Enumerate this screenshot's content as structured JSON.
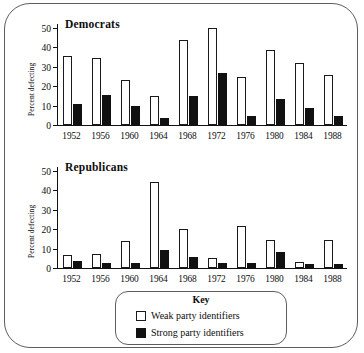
{
  "chart_data": [
    {
      "type": "bar",
      "title": "Democrats",
      "xlabel": "",
      "ylabel": "Percent defecting",
      "categories": [
        "1952",
        "1956",
        "1960",
        "1964",
        "1968",
        "1972",
        "1976",
        "1980",
        "1984",
        "1988"
      ],
      "ylim": [
        0,
        52
      ],
      "yticks": [
        0,
        10,
        20,
        30,
        40,
        50
      ],
      "grid": false,
      "legend_position": "bottom",
      "series": [
        {
          "name": "Weak party identifiers",
          "color": "#ffffff",
          "values": [
            35.5,
            34.5,
            23.0,
            15.0,
            44.0,
            50.0,
            24.5,
            38.5,
            32.0,
            26.0
          ]
        },
        {
          "name": "Strong party identifiers",
          "color": "#111111",
          "values": [
            11.0,
            15.5,
            10.0,
            3.5,
            15.0,
            27.0,
            4.5,
            13.5,
            9.0,
            4.5
          ]
        }
      ]
    },
    {
      "type": "bar",
      "title": "Republicans",
      "xlabel": "",
      "ylabel": "Percent defecting",
      "categories": [
        "1952",
        "1956",
        "1960",
        "1964",
        "1968",
        "1972",
        "1976",
        "1980",
        "1984",
        "1988"
      ],
      "ylim": [
        0,
        52
      ],
      "yticks": [
        0,
        10,
        20,
        30,
        40,
        50
      ],
      "grid": false,
      "legend_position": "bottom",
      "series": [
        {
          "name": "Weak party identifiers",
          "color": "#ffffff",
          "values": [
            6.5,
            7.0,
            14.0,
            44.5,
            20.0,
            5.0,
            21.5,
            14.5,
            3.0,
            14.5
          ]
        },
        {
          "name": "Strong party identifiers",
          "color": "#111111",
          "values": [
            3.5,
            2.5,
            2.5,
            9.5,
            5.5,
            2.5,
            2.5,
            8.5,
            2.0,
            2.0
          ]
        }
      ]
    }
  ],
  "key": {
    "title": "Key",
    "entries": [
      {
        "label": "Weak party identifiers",
        "swatch": "weak"
      },
      {
        "label": "Strong party identifiers",
        "swatch": "strong"
      }
    ]
  }
}
